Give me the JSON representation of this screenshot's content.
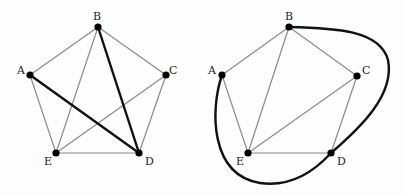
{
  "graphs": [
    {
      "id": "left",
      "nodes": [
        {
          "name": "A",
          "x": 30,
          "y": 75,
          "lx": 17,
          "ly": 74
        },
        {
          "name": "B",
          "x": 98,
          "y": 27,
          "lx": 93,
          "ly": 20
        },
        {
          "name": "C",
          "x": 166,
          "y": 75,
          "lx": 169,
          "ly": 74
        },
        {
          "name": "D",
          "x": 139,
          "y": 153,
          "lx": 145,
          "ly": 165
        },
        {
          "name": "E",
          "x": 56,
          "y": 153,
          "lx": 44,
          "ly": 165
        }
      ],
      "edges": [
        {
          "from": "A",
          "to": "B",
          "style": "thin"
        },
        {
          "from": "B",
          "to": "C",
          "style": "thin"
        },
        {
          "from": "C",
          "to": "D",
          "style": "thin"
        },
        {
          "from": "D",
          "to": "E",
          "style": "thin"
        },
        {
          "from": "E",
          "to": "A",
          "style": "thin"
        },
        {
          "from": "B",
          "to": "E",
          "style": "thin"
        },
        {
          "from": "C",
          "to": "E",
          "style": "thin"
        },
        {
          "from": "A",
          "to": "D",
          "style": "thick"
        },
        {
          "from": "B",
          "to": "D",
          "style": "thick"
        }
      ]
    },
    {
      "id": "right",
      "nodes": [
        {
          "name": "A",
          "x": 222,
          "y": 75,
          "lx": 208,
          "ly": 74
        },
        {
          "name": "B",
          "x": 289,
          "y": 27,
          "lx": 285,
          "ly": 20
        },
        {
          "name": "C",
          "x": 357,
          "y": 76,
          "lx": 362,
          "ly": 74
        },
        {
          "name": "D",
          "x": 331,
          "y": 153,
          "lx": 337,
          "ly": 165
        },
        {
          "name": "E",
          "x": 248,
          "y": 153,
          "lx": 236,
          "ly": 165
        }
      ],
      "edges": [
        {
          "from": "A",
          "to": "B",
          "style": "thin"
        },
        {
          "from": "B",
          "to": "C",
          "style": "thin"
        },
        {
          "from": "C",
          "to": "D",
          "style": "thin"
        },
        {
          "from": "D",
          "to": "E",
          "style": "thin"
        },
        {
          "from": "E",
          "to": "A",
          "style": "thin"
        },
        {
          "from": "B",
          "to": "E",
          "style": "thin"
        },
        {
          "from": "C",
          "to": "E",
          "style": "thin"
        }
      ],
      "curves": [
        {
          "from": "A",
          "to": "B",
          "via": "D",
          "style": "thick",
          "path": "M222,75 C210,110 210,175 260,183 C295,188 320,165 331,153 C360,128 395,95 388,60 C380,30 335,28 289,27"
        }
      ]
    }
  ]
}
